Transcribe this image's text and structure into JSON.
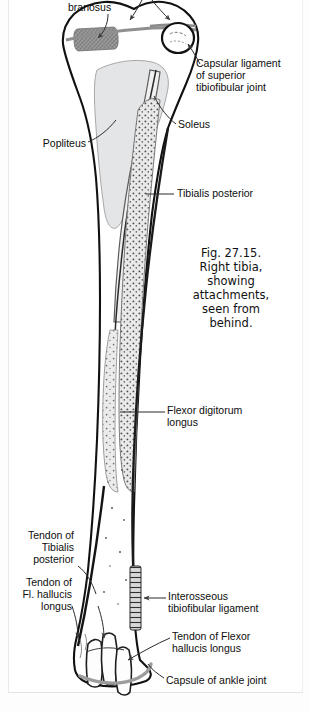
{
  "figure": {
    "caption": "Fig. 27.15.\nRight tibia,\nshowing\nattachments,\nseen from\nbehind.",
    "caption_lines": [
      "Fig. 27.15.",
      "Right tibia,",
      "showing",
      "attachments,",
      "seen from",
      "behind."
    ],
    "colors": {
      "outline": "#111111",
      "background": "#ffffff",
      "bone_fill": "#ffffff",
      "popliteus_fill": "#e2e4e6",
      "soleus_fill": "#efefef",
      "tibialis_posterior_fill": "#e6e6e6",
      "semimembranosus_hatch": "#8d8d8d",
      "capsule_line": "#9a9a9a",
      "label_text": "#0d0d0d",
      "leader_line": "#2b2b2b"
    }
  },
  "labels": [
    {
      "id": "semimembranosus",
      "text": "branosus",
      "align": "left",
      "x": 68,
      "y": 2
    },
    {
      "id": "capsular-ligament-superior-tibiofibular-joint",
      "text": "Capsular ligament\nof superior\ntibiofibular joint",
      "lines": [
        "Capsular ligament",
        "of superior",
        "tibiofibular joint"
      ],
      "align": "left",
      "x": 196,
      "y": 59
    },
    {
      "id": "soleus",
      "text": "Soleus",
      "align": "left",
      "x": 178,
      "y": 120
    },
    {
      "id": "popliteus",
      "text": "Popliteus",
      "align": "left",
      "x": 40,
      "y": 139
    },
    {
      "id": "tibialis-posterior",
      "text": "Tibialis posterior",
      "align": "left",
      "x": 176,
      "y": 189
    },
    {
      "id": "flexor-digitorum-longus",
      "text": "Flexor digitorum\nlongus",
      "lines": [
        "Flexor digitorum",
        "longus"
      ],
      "align": "left",
      "x": 167,
      "y": 405
    },
    {
      "id": "tendon-of-tibialis-posterior",
      "text": "Tendon of\nTibialis\nposterior",
      "lines": [
        "Tendon of",
        "Tibialis",
        "posterior"
      ],
      "align": "right",
      "x": 37,
      "y": 530
    },
    {
      "id": "tendon-of-fl-hallucis-longus",
      "text": "Tendon of\nFl. hallucis\nlongus",
      "lines": [
        "Tendon of",
        "Fl. hallucis",
        "longus"
      ],
      "align": "right",
      "x": 31,
      "y": 577
    },
    {
      "id": "interosseous-tibiofibular-ligament",
      "text": "Interosseous\ntibiofibular ligament",
      "lines": [
        "Interosseous",
        "tibiofibular ligament"
      ],
      "align": "left",
      "x": 168,
      "y": 592
    },
    {
      "id": "tendon-of-flexor-hallucis-longus",
      "text": "Tendon of Flexor\nhallucis longus",
      "lines": [
        "Tendon of Flexor",
        "hallucis longus"
      ],
      "align": "left",
      "x": 172,
      "y": 632
    },
    {
      "id": "capsule-of-ankle-joint",
      "text": "Capsule of ankle joint",
      "align": "left",
      "x": 166,
      "y": 675
    }
  ],
  "caption_box": {
    "x": 172,
    "y": 246,
    "width": 118
  }
}
